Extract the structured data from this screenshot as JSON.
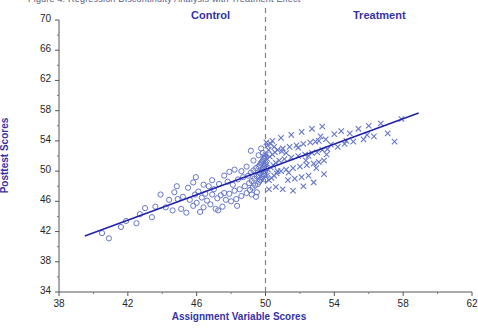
{
  "figure": {
    "caption_clipped": "Figure 4.  Regression Discontinuity Analysis with Treatment Effect",
    "group_labels": {
      "control": "Control",
      "treatment": "Treatment"
    },
    "colors": {
      "accent": "#3333aa",
      "marker": "#6677cc",
      "line": "#2222aa",
      "cutoff": "#808080",
      "tick_text": "#262626"
    }
  },
  "chart_data": {
    "type": "scatter",
    "title": "Regression Discontinuity Analysis with Treatment Effect",
    "xlabel": "Assignment Variable Scores",
    "ylabel": "Posttest Scores",
    "xlim": [
      38,
      62
    ],
    "ylim": [
      34,
      70
    ],
    "xticks": [
      38,
      42,
      46,
      50,
      54,
      58,
      62
    ],
    "yticks": [
      34,
      38,
      42,
      46,
      50,
      54,
      58,
      62,
      66,
      70
    ],
    "grid": false,
    "legend": "none",
    "annotations": [
      {
        "text": "Control",
        "x": 46.9,
        "y": 69.2
      },
      {
        "text": "Treatment",
        "x": 55.9,
        "y": 69.2
      }
    ],
    "cutoff": {
      "x": 50,
      "style": "dashed",
      "label": "cutoff"
    },
    "fit_line": {
      "x": [
        39.5,
        58.9
      ],
      "y": [
        41.4,
        57.7
      ],
      "style": "solid"
    },
    "series": [
      {
        "name": "Control",
        "marker": "open-circle",
        "points": [
          [
            40.9,
            41.1
          ],
          [
            41.6,
            42.6
          ],
          [
            42.5,
            43.1
          ],
          [
            43.0,
            45.1
          ],
          [
            43.4,
            43.9
          ],
          [
            43.6,
            45.3
          ],
          [
            44.2,
            45.2
          ],
          [
            44.4,
            46.2
          ],
          [
            44.6,
            44.8
          ],
          [
            44.9,
            46.3
          ],
          [
            45.1,
            45.0
          ],
          [
            45.2,
            46.6
          ],
          [
            45.4,
            44.5
          ],
          [
            45.5,
            47.8
          ],
          [
            45.6,
            46.2
          ],
          [
            45.8,
            45.4
          ],
          [
            45.9,
            46.9
          ],
          [
            46.0,
            45.8
          ],
          [
            46.1,
            47.3
          ],
          [
            46.2,
            44.6
          ],
          [
            46.3,
            46.5
          ],
          [
            46.4,
            45.2
          ],
          [
            46.5,
            47.0
          ],
          [
            46.6,
            46.1
          ],
          [
            46.7,
            48.0
          ],
          [
            46.8,
            45.6
          ],
          [
            46.9,
            46.9
          ],
          [
            47.0,
            47.6
          ],
          [
            47.1,
            45.0
          ],
          [
            47.2,
            46.4
          ],
          [
            47.3,
            48.3
          ],
          [
            47.4,
            46.8
          ],
          [
            47.5,
            45.3
          ],
          [
            47.6,
            47.1
          ],
          [
            47.7,
            46.2
          ],
          [
            47.8,
            48.6
          ],
          [
            47.9,
            47.0
          ],
          [
            48.0,
            46.0
          ],
          [
            48.1,
            48.2
          ],
          [
            48.2,
            47.4
          ],
          [
            48.3,
            46.3
          ],
          [
            48.4,
            48.9
          ],
          [
            48.5,
            47.6
          ],
          [
            48.6,
            46.7
          ],
          [
            48.7,
            49.2
          ],
          [
            48.8,
            48.0
          ],
          [
            48.9,
            47.1
          ],
          [
            49.0,
            49.4
          ],
          [
            49.05,
            48.4
          ],
          [
            49.1,
            47.5
          ],
          [
            49.15,
            49.8
          ],
          [
            49.2,
            48.7
          ],
          [
            49.25,
            47.8
          ],
          [
            49.3,
            50.1
          ],
          [
            49.35,
            49.0
          ],
          [
            49.4,
            48.1
          ],
          [
            49.45,
            50.4
          ],
          [
            49.5,
            49.3
          ],
          [
            49.55,
            48.3
          ],
          [
            49.6,
            50.6
          ],
          [
            49.62,
            49.5
          ],
          [
            49.64,
            48.6
          ],
          [
            49.66,
            50.8
          ],
          [
            49.68,
            49.7
          ],
          [
            49.7,
            48.8
          ],
          [
            49.72,
            51.0
          ],
          [
            49.74,
            49.9
          ],
          [
            49.76,
            49.0
          ],
          [
            49.78,
            51.2
          ],
          [
            49.8,
            50.1
          ],
          [
            49.82,
            49.2
          ],
          [
            49.84,
            51.4
          ],
          [
            49.86,
            50.3
          ],
          [
            49.88,
            49.4
          ],
          [
            49.9,
            51.6
          ],
          [
            49.91,
            50.5
          ],
          [
            49.92,
            49.6
          ],
          [
            49.93,
            51.8
          ],
          [
            49.94,
            50.7
          ],
          [
            49.95,
            49.8
          ],
          [
            49.96,
            52.0
          ],
          [
            49.97,
            50.9
          ],
          [
            49.98,
            50.0
          ],
          [
            49.99,
            48.9
          ],
          [
            49.995,
            51.1
          ],
          [
            48.2,
            50.2
          ],
          [
            47.6,
            49.4
          ],
          [
            46.9,
            48.8
          ],
          [
            45.8,
            48.5
          ],
          [
            44.7,
            47.2
          ],
          [
            48.9,
            50.6
          ],
          [
            49.3,
            51.4
          ],
          [
            49.6,
            52.1
          ],
          [
            49.85,
            52.4
          ],
          [
            49.5,
            47.2
          ],
          [
            49.2,
            46.9
          ],
          [
            48.6,
            50.0
          ],
          [
            47.9,
            49.9
          ],
          [
            46.4,
            48.2
          ],
          [
            43.9,
            46.9
          ],
          [
            42.7,
            44.3
          ],
          [
            41.9,
            43.4
          ],
          [
            40.5,
            41.8
          ],
          [
            49.45,
            46.6
          ],
          [
            48.35,
            45.4
          ],
          [
            47.25,
            44.8
          ],
          [
            45.95,
            49.2
          ],
          [
            44.85,
            48.0
          ],
          [
            49.15,
            52.7
          ],
          [
            49.75,
            53.0
          ]
        ]
      },
      {
        "name": "Treatment",
        "marker": "x",
        "points": [
          [
            50.02,
            52.2
          ],
          [
            50.05,
            50.8
          ],
          [
            50.08,
            49.4
          ],
          [
            50.1,
            51.6
          ],
          [
            50.15,
            50.2
          ],
          [
            50.2,
            48.8
          ],
          [
            50.25,
            51.9
          ],
          [
            50.3,
            50.5
          ],
          [
            50.35,
            49.1
          ],
          [
            50.4,
            52.2
          ],
          [
            50.45,
            50.8
          ],
          [
            50.5,
            49.4
          ],
          [
            50.55,
            52.5
          ],
          [
            50.6,
            51.1
          ],
          [
            50.65,
            49.7
          ],
          [
            50.7,
            52.8
          ],
          [
            50.8,
            51.4
          ],
          [
            50.9,
            50.0
          ],
          [
            51.0,
            53.0
          ],
          [
            51.1,
            51.6
          ],
          [
            51.2,
            50.2
          ],
          [
            51.3,
            48.8
          ],
          [
            51.4,
            53.2
          ],
          [
            51.5,
            51.8
          ],
          [
            51.6,
            50.4
          ],
          [
            51.7,
            49.0
          ],
          [
            51.8,
            53.4
          ],
          [
            51.9,
            52.0
          ],
          [
            52.0,
            50.6
          ],
          [
            52.1,
            49.2
          ],
          [
            52.2,
            53.6
          ],
          [
            52.3,
            52.2
          ],
          [
            52.4,
            50.8
          ],
          [
            52.5,
            49.4
          ],
          [
            52.6,
            53.8
          ],
          [
            52.7,
            52.4
          ],
          [
            52.8,
            51.0
          ],
          [
            52.9,
            53.9
          ],
          [
            53.0,
            52.5
          ],
          [
            53.1,
            51.2
          ],
          [
            53.2,
            54.6
          ],
          [
            53.3,
            52.8
          ],
          [
            53.4,
            51.4
          ],
          [
            53.5,
            54.2
          ],
          [
            53.6,
            52.9
          ],
          [
            53.8,
            53.5
          ],
          [
            54.0,
            54.9
          ],
          [
            54.2,
            53.2
          ],
          [
            54.4,
            55.3
          ],
          [
            54.6,
            53.6
          ],
          [
            54.9,
            55.0
          ],
          [
            55.1,
            53.9
          ],
          [
            55.4,
            55.6
          ],
          [
            55.7,
            54.2
          ],
          [
            56.0,
            56.0
          ],
          [
            56.3,
            54.6
          ],
          [
            56.7,
            56.3
          ],
          [
            57.1,
            55.0
          ],
          [
            57.5,
            53.9
          ],
          [
            57.9,
            56.9
          ],
          [
            50.12,
            53.4
          ],
          [
            50.3,
            53.6
          ],
          [
            50.6,
            47.9
          ],
          [
            51.0,
            47.6
          ],
          [
            51.6,
            47.4
          ],
          [
            52.2,
            48.0
          ],
          [
            52.8,
            48.5
          ],
          [
            53.4,
            49.6
          ],
          [
            50.4,
            54.0
          ],
          [
            50.9,
            54.4
          ],
          [
            51.5,
            54.8
          ],
          [
            52.1,
            55.2
          ],
          [
            52.7,
            55.6
          ],
          [
            53.3,
            55.9
          ],
          [
            51.2,
            52.4
          ],
          [
            51.9,
            53.1
          ],
          [
            52.5,
            52.0
          ],
          [
            53.1,
            54.0
          ],
          [
            50.7,
            50.0
          ],
          [
            50.2,
            47.6
          ],
          [
            50.5,
            53.2
          ],
          [
            51.35,
            49.8
          ],
          [
            52.35,
            51.4
          ],
          [
            53.55,
            52.2
          ],
          [
            50.95,
            52.6
          ],
          [
            52.95,
            50.4
          ],
          [
            54.7,
            54.0
          ],
          [
            55.9,
            54.8
          ],
          [
            50.05,
            53.8
          ],
          [
            50.18,
            52.8
          ]
        ]
      }
    ]
  }
}
